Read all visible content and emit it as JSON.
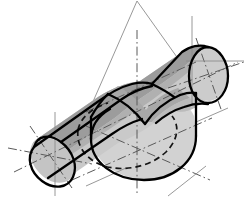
{
  "figure": {
    "title": "Isometric technical drawing of two intersecting cylinders",
    "background_color": "#ffffff",
    "outline_color": "#000000",
    "construction_line_color": "#8c8c8c",
    "centerline_color": "#5a5a5a",
    "hidden_line_color": "#1a1a1a",
    "shading": {
      "top_face_dark": "#9c9c9c",
      "cylinder_body_mid": "#bdbdbd",
      "cylinder_body_light": "#c9c9c9",
      "large_cylinder_face": "#d2d2d2",
      "end_cap_light": "#cccccc",
      "saddle_shadow": "#a8a8a8"
    },
    "parts": [
      {
        "name": "inclined-cylinder",
        "label": "Inclined cylinder",
        "axis_angle_deg": -28,
        "end_cap_left_center": [
          55,
          148
        ],
        "end_cap_right_center": [
          200,
          78
        ]
      },
      {
        "name": "vertical-cylinder",
        "label": "Large vertical cylinder",
        "axis_vertical_x": 146,
        "bottom_ellipse_center": [
          146,
          152
        ]
      },
      {
        "name": "intersection-curve",
        "label": "Hidden intersection curve",
        "line_style": "dashed"
      },
      {
        "name": "construction-apex",
        "label": "Construction apex",
        "position": [
          137,
          2
        ]
      }
    ],
    "centerlines": [
      {
        "name": "inclined-axis-centerline",
        "style": "dash-dot"
      },
      {
        "name": "vertical-axis-centerline",
        "style": "dash-dot"
      },
      {
        "name": "left-cap-crosshair",
        "style": "dash-dot"
      },
      {
        "name": "right-cap-crosshair",
        "style": "dash-dot"
      },
      {
        "name": "bottom-ellipse-crosshair",
        "style": "dash-dot"
      }
    ]
  }
}
